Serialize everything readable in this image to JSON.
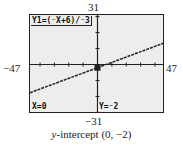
{
  "window": {
    "xmin": "−47",
    "xmax": "47",
    "ymin": "−31",
    "ymax": "31"
  },
  "screen": {
    "equation": "Y1=(⁻X+6)/⁻3",
    "x_readout": "X=0",
    "y_readout": "Y=⁻2"
  },
  "caption": {
    "italic": "y",
    "rest": "-intercept (0, −2)"
  },
  "colors": {
    "screen_bg": "#ededed",
    "ink": "#222222"
  },
  "chart_data": {
    "type": "line",
    "xlabel": "",
    "ylabel": "",
    "xlim": [
      -47,
      47
    ],
    "ylim": [
      -31,
      31
    ],
    "series": [
      {
        "name": "Y1",
        "equation": "y = (-x + 6) / -3 = x/3 - 2",
        "x": [
          -47,
          0,
          6,
          47
        ],
        "values": [
          -17.67,
          -2,
          0,
          13.67
        ]
      }
    ],
    "trace_point": {
      "x": 0,
      "y": -2
    },
    "annotations": [
      "X=0",
      "Y=-2",
      "y-intercept (0, -2)"
    ],
    "grid": false,
    "axis_ticks": "every 10 units"
  }
}
